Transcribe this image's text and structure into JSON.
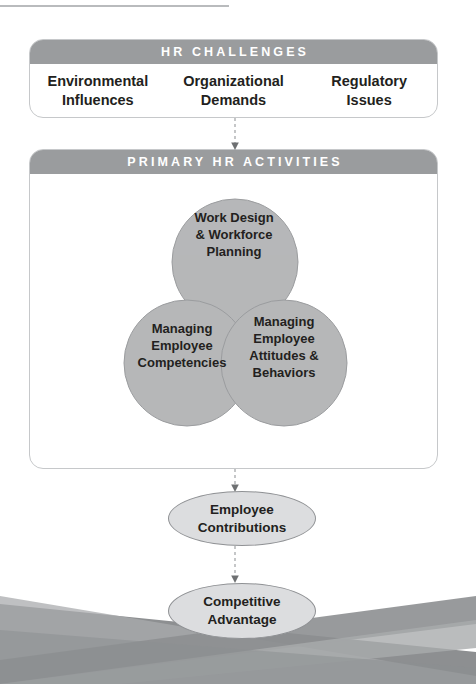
{
  "challenges_panel": {
    "header": "HR CHALLENGES",
    "columns": [
      {
        "line1": "Environmental",
        "line2": "Influences"
      },
      {
        "line1": "Organizational",
        "line2": "Demands"
      },
      {
        "line1": "Regulatory",
        "line2": "Issues"
      }
    ]
  },
  "activities_panel": {
    "header": "PRIMARY HR ACTIVITIES",
    "venn": {
      "circles": [
        {
          "id": "work-design",
          "position": "top",
          "lines": [
            "Work Design",
            "& Workforce",
            "Planning"
          ]
        },
        {
          "id": "competencies",
          "position": "bottom-left",
          "lines": [
            "Managing",
            "Employee",
            "Competencies"
          ]
        },
        {
          "id": "attitudes",
          "position": "bottom-right",
          "lines": [
            "Managing",
            "Employee",
            "Attitudes &",
            "Behaviors"
          ]
        }
      ]
    }
  },
  "outcomes": [
    {
      "id": "employee-contributions",
      "lines": [
        "Employee",
        "Contributions"
      ]
    },
    {
      "id": "competitive-advantage",
      "lines": [
        "Competitive",
        "Advantage"
      ]
    }
  ],
  "colors": {
    "header_bar": "#9a9c9e",
    "panel_border": "#c6c8ca",
    "circle_fill": "#b6b8ba",
    "circle_stroke": "#8c8e90",
    "oval_fill": "#dcdddf",
    "oval_stroke": "#8f9194",
    "text": "#231f20",
    "ribbon_dark": "#8d8f91",
    "ribbon_light": "#a9abad",
    "rule": "#b9bbbd"
  }
}
